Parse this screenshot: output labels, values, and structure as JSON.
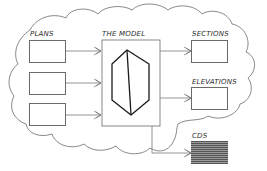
{
  "diagram": {
    "type": "flow",
    "container": "cloud-outline",
    "nodes": {
      "plans": {
        "label": "PLANS",
        "boxes": 3
      },
      "model": {
        "label": "THE MODEL",
        "icon": "hexagon-prism-icon"
      },
      "sections": {
        "label": "SECTIONS"
      },
      "elevations": {
        "label": "ELEVATIONS"
      },
      "cds": {
        "label": "CDS",
        "fill": "hatched"
      }
    },
    "edges": [
      {
        "from": "plans-box-1",
        "to": "model"
      },
      {
        "from": "plans-box-2",
        "to": "model"
      },
      {
        "from": "plans-box-3",
        "to": "model"
      },
      {
        "from": "model",
        "to": "sections"
      },
      {
        "from": "model",
        "to": "elevations"
      },
      {
        "from": "model",
        "to": "cds"
      }
    ],
    "colors": {
      "line": "#6a6a6a",
      "model_shape": "#1a1a1a",
      "hatch_dark": "#555555",
      "hatch_light": "#9a9a9a"
    }
  }
}
